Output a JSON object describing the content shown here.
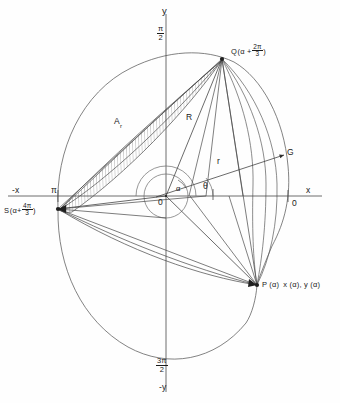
{
  "figure": {
    "axes": {
      "y_top": "y",
      "y_bottom": "-y",
      "x_right": "x",
      "x_left": "-x",
      "origin": "0",
      "origin_right": "0",
      "angle_top": {
        "num": "π",
        "den": "2"
      },
      "angle_bottom": {
        "num": "3π",
        "den": "2"
      },
      "angle_left": "π"
    },
    "points": [
      {
        "id": "Q",
        "name": "Q",
        "arg_prefix": "(α +",
        "arg_num": "2π",
        "arg_den": "3",
        "arg_suffix": ")",
        "full_label": "Q (α + 2π/3)"
      },
      {
        "id": "S",
        "name": "S",
        "arg_prefix": "(α+",
        "arg_num": "4π",
        "arg_den": "3",
        "arg_suffix": ")",
        "full_label": "S (α + 4π/3)"
      },
      {
        "id": "P",
        "name": "P (α)",
        "coords": "x (α), y (α)",
        "full_label": "P (α)  x (α), y (α)"
      },
      {
        "id": "G",
        "name": "G",
        "full_label": "G"
      }
    ],
    "segments": {
      "radius_major": "R",
      "radius_minor": "r"
    },
    "angles": {
      "alpha": "α",
      "theta": "θ"
    },
    "regions": {
      "hatched_area_base": "A",
      "hatched_area_sub": "r",
      "hatched_area_label": "Aᵣ"
    },
    "colors": {
      "stroke": "#3a3a3a",
      "stroke_light": "#6e6e6e",
      "axis": "#4a4a4a",
      "text": "#1a1a1a",
      "background": "#fefefe"
    }
  }
}
